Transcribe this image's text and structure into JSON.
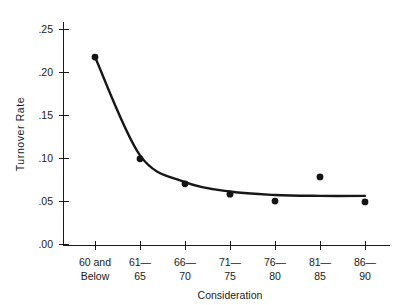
{
  "chart_data": {
    "type": "scatter",
    "title": "",
    "subtitle": "",
    "xlabel": "Consideration",
    "ylabel": "Turnover Rate",
    "categories": [
      "60 and Below",
      "61-65",
      "66-70",
      "71-75",
      "76-80",
      "81-85",
      "86-90"
    ],
    "category_lines": [
      [
        "60 and",
        "Below"
      ],
      [
        "61—",
        "65"
      ],
      [
        "66—",
        "70"
      ],
      [
        "71—",
        "75"
      ],
      [
        "76—",
        "80"
      ],
      [
        "81—",
        "85"
      ],
      [
        "86—",
        "90"
      ]
    ],
    "values": [
      0.218,
      0.1,
      0.071,
      0.059,
      0.051,
      0.079,
      0.05
    ],
    "series": [
      {
        "name": "Turnover Rate",
        "values": [
          0.218,
          0.1,
          0.071,
          0.059,
          0.051,
          0.079,
          0.05
        ]
      },
      {
        "name": "Fitted curve",
        "type": "line",
        "values": [
          0.218,
          0.104,
          0.073,
          0.062,
          0.058,
          0.057,
          0.057
        ]
      }
    ],
    "ylim": [
      0.0,
      0.25
    ],
    "yticks": [
      0.0,
      0.05,
      0.1,
      0.15,
      0.2,
      0.25
    ],
    "ytick_labels": [
      ".00",
      ".05",
      ".10",
      ".15",
      ".20",
      ".25"
    ],
    "grid": false,
    "legend": "none",
    "marker": "filled-circle",
    "marker_color": "#141414",
    "curve_color": "#171717",
    "axis_color": "#1a1a1a",
    "background_color": "#ffffff"
  }
}
